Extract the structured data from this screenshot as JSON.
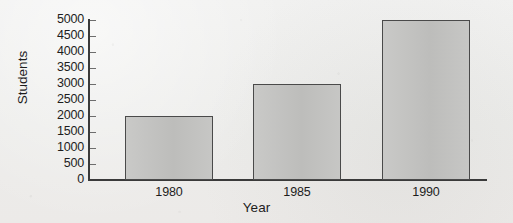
{
  "chart_data": {
    "type": "bar",
    "title": "",
    "xlabel": "Year",
    "ylabel": "Students",
    "categories": [
      "1980",
      "1985",
      "1990"
    ],
    "values": [
      2000,
      3000,
      5000
    ],
    "ylim": [
      0,
      5000
    ],
    "ytick_labels": [
      "5000",
      "4500",
      "4000",
      "3500",
      "3000",
      "2500",
      "2000",
      "1500",
      "1000",
      "500",
      "0"
    ],
    "ytick_values": [
      5000,
      4500,
      4000,
      3500,
      3000,
      2500,
      2000,
      1500,
      1000,
      500,
      0
    ],
    "ytick_step": 500,
    "grid": false,
    "legend": "none",
    "series": [
      {
        "name": "Students",
        "values": [
          2000,
          3000,
          5000
        ]
      }
    ],
    "colors": {
      "bar_fill": "#c3c3c1",
      "bar_border": "#4a4a4a",
      "axis": "#3a3a3a",
      "text": "#1d1d1d",
      "background": "#efefee"
    }
  }
}
